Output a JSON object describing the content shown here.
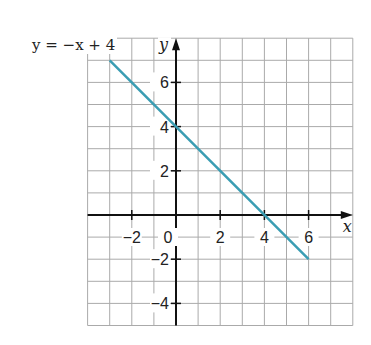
{
  "chart_data": {
    "type": "line",
    "title": "",
    "equation_label": "y = −x + 4",
    "xlabel": "x",
    "ylabel": "y",
    "xlim": [
      -4,
      8
    ],
    "ylim": [
      -5,
      8
    ],
    "grid": true,
    "x_ticks": [
      -2,
      0,
      2,
      4,
      6
    ],
    "y_ticks": [
      -4,
      -2,
      2,
      4,
      6
    ],
    "x_tick_labels": [
      "−2",
      "0",
      "2",
      "4",
      "6"
    ],
    "y_tick_labels": [
      "−4",
      "−2",
      "2",
      "4",
      "6"
    ],
    "series": [
      {
        "name": "y = −x + 4",
        "color": "#3a9db3",
        "x": [
          -3,
          6
        ],
        "y": [
          7,
          -2
        ]
      }
    ],
    "key_points": [
      {
        "x": 0,
        "y": 4,
        "label": "y-intercept"
      },
      {
        "x": 4,
        "y": 0,
        "label": "x-intercept"
      }
    ]
  },
  "labels": {
    "equation": "y = −x + 4",
    "x_axis": "x",
    "y_axis": "y"
  }
}
